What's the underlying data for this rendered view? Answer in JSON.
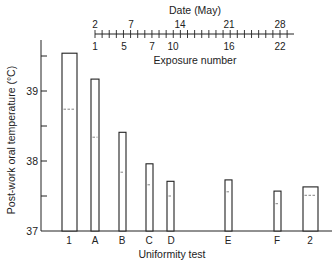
{
  "chart_data": {
    "type": "bar",
    "title": "",
    "xlabel": "Uniformity test",
    "ylabel": "Post-work oral temperature (°C)",
    "ylim": [
      37,
      39.7
    ],
    "yticks": [
      37,
      37.5,
      38,
      38.5,
      39,
      39.5
    ],
    "ytick_labels": [
      "37",
      "",
      "38",
      "",
      "39",
      ""
    ],
    "grid": false,
    "categories": [
      "1",
      "A",
      "B",
      "C",
      "D",
      "E",
      "F",
      "2"
    ],
    "series": [
      {
        "name": "Bar top (maximum)",
        "values": [
          39.54,
          39.17,
          38.41,
          37.96,
          37.71,
          37.73,
          37.57,
          37.63
        ]
      },
      {
        "name": "Dashed line (mean)",
        "values": [
          38.74,
          38.34,
          37.84,
          37.66,
          37.5,
          37.56,
          37.39,
          37.51
        ]
      }
    ],
    "top_axis": {
      "label": "Date (May)",
      "date_ticks": [
        "2",
        "7",
        "14",
        "21",
        "28"
      ],
      "exposure_label": "Exposure number",
      "exposure_ticks": [
        "1",
        "5",
        "7",
        "10",
        "16",
        "22"
      ]
    }
  },
  "labels": {
    "top_axis_title": "Date (May)",
    "exposure_title": "Exposure number",
    "x_title": "Uniformity test",
    "y_title": "Post-work oral temperature (°C)",
    "y37": "37",
    "y38": "38",
    "y39": "39",
    "d2": "2",
    "d7": "7",
    "d14": "14",
    "d21": "21",
    "d28": "28",
    "e1": "1",
    "e5": "5",
    "e7": "7",
    "e10": "10",
    "e16": "16",
    "e22": "22",
    "c1": "1",
    "cA": "A",
    "cB": "B",
    "cC": "C",
    "cD": "D",
    "cE": "E",
    "cF": "F",
    "c2": "2"
  }
}
